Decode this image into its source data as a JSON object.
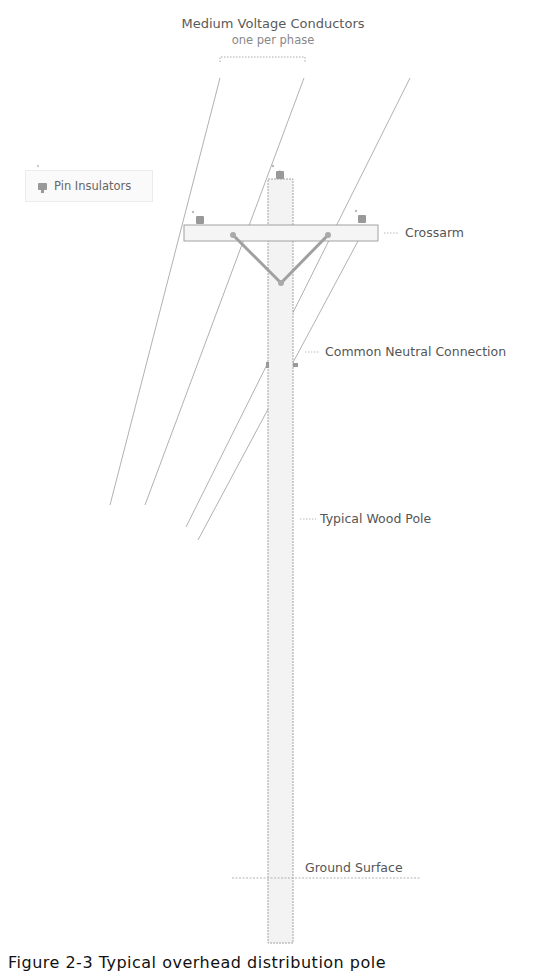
{
  "diagram": {
    "title": "Medium Voltage Conductors",
    "subtitle": "one per phase",
    "legend": {
      "items": [
        {
          "icon": "pin-insulator-icon",
          "label": "Pin Insulators"
        }
      ]
    },
    "labels": {
      "crossarm": "Crossarm",
      "neutral": "Common Neutral Connection",
      "pole": "Typical Wood Pole",
      "ground": "Ground Surface"
    },
    "caption": "Figure 2-3 Typical overhead distribution pole",
    "colors": {
      "pole_fill": "#f3f3f3",
      "outline": "#9a9a9a",
      "brace": "#a0a0a0",
      "text": "#555555"
    }
  }
}
